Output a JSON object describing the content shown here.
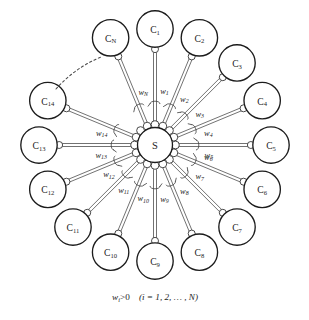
{
  "figure": {
    "background_color": "#ffffff",
    "stroke_color": "#1c1c1c",
    "width": 309,
    "height": 320
  },
  "hub": {
    "label": "S",
    "cx": 155,
    "cy": 145,
    "r": 17.5,
    "rim_joint_count": 16,
    "rim_joint_r": 3.9
  },
  "geometry": {
    "node_r": 18.2,
    "node_orbit_r": 116,
    "joint_r": 3.5,
    "rod_half_gap": 1.5
  },
  "caption": {
    "w": "w",
    "sub_i": "i",
    "relation": ">0",
    "range": "(i = 1, 2, … , N)",
    "x": 155,
    "y": 297
  },
  "dashed_gap": {
    "x1": 56,
    "y1": 89,
    "x2": 101,
    "y2": 57,
    "meaning": "omitted-nodes-ellipsis"
  },
  "nodes": [
    {
      "id": "C1",
      "label": "C",
      "sub": "1",
      "angle_deg": -90,
      "w_label": "w",
      "w_sub": "1",
      "w_side": 1
    },
    {
      "id": "C2",
      "label": "C",
      "sub": "2",
      "angle_deg": -67.5,
      "w_label": "w",
      "w_sub": "2",
      "w_side": 1
    },
    {
      "id": "C3",
      "label": "C",
      "sub": "3",
      "angle_deg": -45,
      "w_label": "w",
      "w_sub": "3",
      "w_side": 1
    },
    {
      "id": "C4",
      "label": "C",
      "sub": "4",
      "angle_deg": -22.5,
      "w_label": "w",
      "w_sub": "4",
      "w_side": 1
    },
    {
      "id": "C5",
      "label": "C",
      "sub": "5",
      "angle_deg": 0,
      "w_label": "w",
      "w_sub": "5",
      "w_side": 1
    },
    {
      "id": "C6",
      "label": "C",
      "sub": "6",
      "angle_deg": 22.5,
      "w_label": "w",
      "w_sub": "6",
      "w_side": -1
    },
    {
      "id": "C7",
      "label": "C",
      "sub": "7",
      "angle_deg": 45,
      "w_label": "w",
      "w_sub": "7",
      "w_side": -1
    },
    {
      "id": "C8",
      "label": "C",
      "sub": "8",
      "angle_deg": 67.5,
      "w_label": "w",
      "w_sub": "8",
      "w_side": -1
    },
    {
      "id": "C9",
      "label": "C",
      "sub": "9",
      "angle_deg": 90,
      "w_label": "w",
      "w_sub": "9",
      "w_side": -1
    },
    {
      "id": "C10",
      "label": "C",
      "sub": "10",
      "angle_deg": 112.5,
      "w_label": "w",
      "w_sub": "10",
      "w_side": -1
    },
    {
      "id": "C11",
      "label": "C",
      "sub": "11",
      "angle_deg": 135,
      "w_label": "w",
      "w_sub": "11",
      "w_side": -1
    },
    {
      "id": "C12",
      "label": "C",
      "sub": "12",
      "angle_deg": 157.5,
      "w_label": "w",
      "w_sub": "12",
      "w_side": -1
    },
    {
      "id": "C13",
      "label": "C",
      "sub": "13",
      "angle_deg": 180,
      "w_label": "w",
      "w_sub": "13",
      "w_side": -1
    },
    {
      "id": "C14",
      "label": "C",
      "sub": "14",
      "angle_deg": 202.5,
      "w_label": "w",
      "w_sub": "14",
      "w_side": -1
    },
    {
      "id": "CN",
      "label": "C",
      "sub": "N",
      "angle_deg": 247.5,
      "w_label": "w",
      "w_sub": "N",
      "w_side": 1
    }
  ]
}
